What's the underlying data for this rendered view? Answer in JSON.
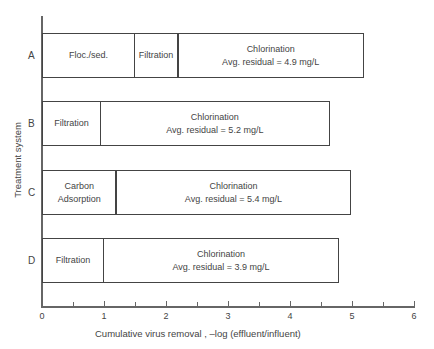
{
  "chart_data": {
    "type": "bar",
    "orientation": "horizontal",
    "stacked": true,
    "title": "",
    "xlabel": "Cumulative virus removal , –log (effluent/influent)",
    "ylabel": "Treatment system",
    "xlim": [
      0,
      6
    ],
    "x_ticks": [
      0,
      1,
      2,
      3,
      4,
      5,
      6
    ],
    "x_minor_ticks": [
      0.5,
      1.5,
      2.5,
      3.5,
      4.5,
      5.5
    ],
    "grid": false,
    "legend": null,
    "categories": [
      "A",
      "B",
      "C",
      "D"
    ],
    "bars": [
      {
        "category": "A",
        "segments": [
          {
            "label": "Floc./sed.",
            "start": 0,
            "end": 1.5
          },
          {
            "label": "Filtration",
            "start": 1.5,
            "end": 2.2
          },
          {
            "label": "Chlorination\nAvg. residual = 4.9 mg/L",
            "start": 2.2,
            "end": 5.2
          }
        ],
        "total": 5.2
      },
      {
        "category": "B",
        "segments": [
          {
            "label": "Filtration",
            "start": 0,
            "end": 0.95
          },
          {
            "label": "Chlorination\nAvg. residual = 5.2 mg/L",
            "start": 0.95,
            "end": 4.65
          }
        ],
        "total": 4.65
      },
      {
        "category": "C",
        "segments": [
          {
            "label": "Carbon\nAdsorption",
            "start": 0,
            "end": 1.2
          },
          {
            "label": "Chlorination\nAvg. residual = 5.4 mg/L",
            "start": 1.2,
            "end": 5.0
          }
        ],
        "total": 5.0
      },
      {
        "category": "D",
        "segments": [
          {
            "label": "Filtration",
            "start": 0,
            "end": 1.0
          },
          {
            "label": "Chlorination\nAvg. residual = 3.9 mg/L",
            "start": 1.0,
            "end": 4.8
          }
        ],
        "total": 4.8
      }
    ]
  },
  "layout": {
    "origin_x_px": 42,
    "px_per_unit": 62,
    "bar_tops_px": [
      33,
      101,
      170,
      238
    ]
  }
}
